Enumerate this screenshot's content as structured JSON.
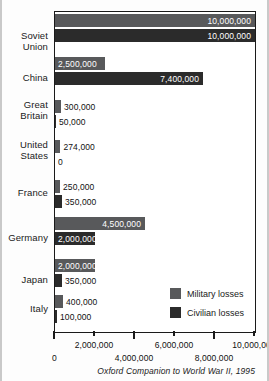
{
  "chart_data": {
    "type": "bar",
    "orientation": "horizontal",
    "title": "",
    "subtitle": "",
    "xlabel": "",
    "ylabel": "",
    "xlim": [
      0,
      10000000
    ],
    "grid": false,
    "legend_position": "inside-bottom-right",
    "source": "Oxford Companion to World War II, 1995",
    "categories": [
      "Soviet Union",
      "China",
      "Great Britain",
      "United States",
      "France",
      "Germany",
      "Japan",
      "Italy"
    ],
    "series": [
      {
        "name": "Military losses",
        "color": "#58595b",
        "values": [
          10000000,
          2500000,
          300000,
          274000,
          250000,
          4500000,
          2000000,
          400000
        ],
        "labels": [
          "10,000,000",
          "2,500,000",
          "300,000",
          "274,000",
          "250,000",
          "4,500,000",
          "2,000,000",
          "400,000"
        ]
      },
      {
        "name": "Civilian losses",
        "color": "#2b2b2b",
        "values": [
          10000000,
          7400000,
          50000,
          0,
          350000,
          2000000,
          350000,
          100000
        ],
        "labels": [
          "10,000,000",
          "7,400,000",
          "50,000",
          "0",
          "350,000",
          "2,000,000",
          "350,000",
          "100,000"
        ]
      }
    ],
    "xticks": [
      0,
      2000000,
      4000000,
      6000000,
      8000000,
      10000000
    ],
    "xtick_labels": [
      "0",
      "2,000,000",
      "4,000,000",
      "6,000,000",
      "8,000,000",
      "10,000,000"
    ]
  },
  "axis": {
    "ticks": [
      {
        "label": "0",
        "value": 0,
        "row": "lower"
      },
      {
        "label": "2,000,000",
        "value": 2000000,
        "row": "upper"
      },
      {
        "label": "4,000,000",
        "value": 4000000,
        "row": "lower"
      },
      {
        "label": "6,000,000",
        "value": 6000000,
        "row": "upper"
      },
      {
        "label": "8,000,000",
        "value": 8000000,
        "row": "lower"
      },
      {
        "label": "10,000,000",
        "value": 10000000,
        "row": "upper"
      }
    ]
  },
  "legend": {
    "items": [
      {
        "label": "Military losses",
        "color": "#58595b"
      },
      {
        "label": "Civilian losses",
        "color": "#2b2b2b"
      }
    ]
  },
  "source": {
    "text": "Oxford Companion to World War II, 1995"
  },
  "rows": [
    {
      "name": "Soviet Union",
      "label_lines": [
        "Soviet",
        "Union"
      ],
      "top": 14,
      "label_top": 30,
      "military": {
        "value": 10000000,
        "label": "10,000,000",
        "label_pos": "inside"
      },
      "civilian": {
        "value": 10000000,
        "label": "10,000,000",
        "label_pos": "inside"
      }
    },
    {
      "name": "China",
      "label_lines": [
        "China"
      ],
      "top": 57,
      "label_top": 72,
      "military": {
        "value": 2500000,
        "label": "2,500,000",
        "label_pos": "inside-left"
      },
      "civilian": {
        "value": 7400000,
        "label": "7,400,000",
        "label_pos": "inside"
      }
    },
    {
      "name": "Great Britain",
      "label_lines": [
        "Great",
        "Britain"
      ],
      "top": 100,
      "label_top": 99,
      "military": {
        "value": 300000,
        "label": "300,000",
        "label_pos": "outside"
      },
      "civilian": {
        "value": 50000,
        "label": "50,000",
        "label_pos": "outside"
      }
    },
    {
      "name": "United States",
      "label_lines": [
        "United",
        "States"
      ],
      "top": 140,
      "label_top": 139,
      "military": {
        "value": 274000,
        "label": "274,000",
        "label_pos": "outside"
      },
      "civilian": {
        "value": 0,
        "label": "0",
        "label_pos": "outside"
      }
    },
    {
      "name": "France",
      "label_lines": [
        "France"
      ],
      "top": 180,
      "label_top": 187,
      "military": {
        "value": 250000,
        "label": "250,000",
        "label_pos": "outside"
      },
      "civilian": {
        "value": 350000,
        "label": "350,000",
        "label_pos": "outside"
      }
    },
    {
      "name": "Germany",
      "label_lines": [
        "Germany"
      ],
      "top": 217,
      "label_top": 232,
      "military": {
        "value": 4500000,
        "label": "4,500,000",
        "label_pos": "inside"
      },
      "civilian": {
        "value": 2000000,
        "label": "2,000,000",
        "label_pos": "inside-left"
      }
    },
    {
      "name": "Japan",
      "label_lines": [
        "Japan"
      ],
      "top": 259,
      "label_top": 274,
      "military": {
        "value": 2000000,
        "label": "2,000,000",
        "label_pos": "inside-left"
      },
      "civilian": {
        "value": 350000,
        "label": "350,000",
        "label_pos": "outside"
      }
    },
    {
      "name": "Italy",
      "label_lines": [
        "Italy"
      ],
      "top": 295,
      "label_top": 303,
      "military": {
        "value": 400000,
        "label": "400,000",
        "label_pos": "outside"
      },
      "civilian": {
        "value": 100000,
        "label": "100,000",
        "label_pos": "outside"
      }
    }
  ]
}
